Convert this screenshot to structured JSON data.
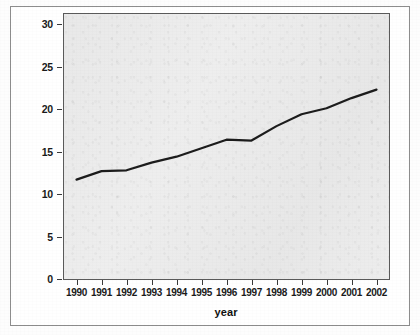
{
  "chart_data": {
    "type": "line",
    "title": "",
    "xlabel": "year",
    "ylabel": "",
    "categories": [
      "1990",
      "1991",
      "1992",
      "1993",
      "1994",
      "1995",
      "1996",
      "1997",
      "1998",
      "1999",
      "2000",
      "2001",
      "2002"
    ],
    "x": [
      1990,
      1991,
      1992,
      1993,
      1994,
      1995,
      1996,
      1997,
      1998,
      1999,
      2000,
      2001,
      2002
    ],
    "values": [
      11.7,
      12.7,
      12.8,
      13.7,
      14.4,
      15.4,
      16.4,
      16.3,
      18.0,
      19.4,
      20.1,
      21.3,
      22.3
    ],
    "series": [
      {
        "name": "series-1",
        "values": [
          11.7,
          12.7,
          12.8,
          13.7,
          14.4,
          15.4,
          16.4,
          16.3,
          18.0,
          19.4,
          20.1,
          21.3,
          22.3
        ],
        "color": "#1c1c1c"
      }
    ],
    "xlim": [
      1989.5,
      2002.5
    ],
    "ylim": [
      0,
      31.2
    ],
    "yticks": [
      0,
      5,
      10,
      15,
      20,
      25,
      30
    ],
    "ytick_labels": [
      "0",
      "5",
      "10",
      "15",
      "20",
      "25",
      "30"
    ],
    "xticks": [
      1990,
      1991,
      1992,
      1993,
      1994,
      1995,
      1996,
      1997,
      1998,
      1999,
      2000,
      2001,
      2002
    ],
    "grid": false,
    "legend": false,
    "legend_position": "none",
    "plot_background": "#ededed",
    "line_color": "#1c1c1c",
    "frame_color": "#5a5a5a",
    "outer_border_color": "#8d8d8d"
  }
}
